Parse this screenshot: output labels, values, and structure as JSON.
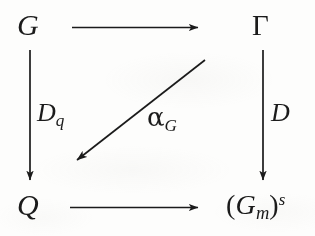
{
  "diagram": {
    "kind": "commutative-diagram",
    "ink_color": "#1b1b1b",
    "background_color": "#fdfdfc",
    "nodes": [
      {
        "id": "top-left",
        "text": "G",
        "position": "top-left"
      },
      {
        "id": "top-right",
        "text": "Γ",
        "position": "top-right"
      },
      {
        "id": "bottom-left",
        "text": "Q",
        "position": "bottom-left"
      },
      {
        "id": "bottom-right",
        "base": "G",
        "subscript": "m",
        "superscript": "s",
        "open_paren": "(",
        "close_paren": ")",
        "text": "(G_m)^s",
        "position": "bottom-right"
      }
    ],
    "arrows": [
      {
        "id": "top",
        "from": "G",
        "to": "Γ",
        "direction": "right",
        "label": ""
      },
      {
        "id": "left",
        "from": "G",
        "to": "Q",
        "direction": "down",
        "label": "D_q"
      },
      {
        "id": "right",
        "from": "Γ",
        "to": "(G_m)^s",
        "direction": "down",
        "label": "D"
      },
      {
        "id": "bottom",
        "from": "Q",
        "to": "(G_m)^s",
        "direction": "right",
        "label": ""
      },
      {
        "id": "diagonal",
        "from": "Γ",
        "to": "Q",
        "direction": "down-left",
        "label": "α_G"
      }
    ],
    "labels": {
      "left_arrow": {
        "base": "D",
        "subscript": "q",
        "text": "D_q"
      },
      "diagonal_arrow": {
        "base": "α",
        "subscript": "G",
        "text": "α_G"
      },
      "right_arrow": {
        "base": "D",
        "subscript": "",
        "text": "D"
      }
    }
  }
}
